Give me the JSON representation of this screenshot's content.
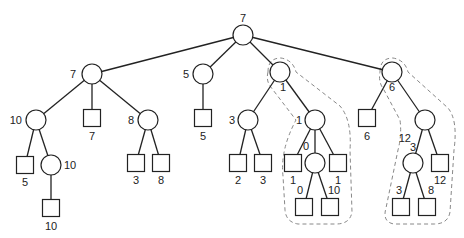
{
  "diagram": {
    "type": "game-tree",
    "node_radius": 10,
    "square_size": 17,
    "nodes": [
      {
        "id": "root",
        "shape": "circle",
        "x": 243,
        "y": 35,
        "label": "7",
        "lx": 243,
        "ly": 22,
        "anchor": "middle"
      },
      {
        "id": "a",
        "shape": "circle",
        "x": 92,
        "y": 74,
        "label": "7",
        "lx": 76,
        "ly": 78,
        "anchor": "end"
      },
      {
        "id": "b",
        "shape": "circle",
        "x": 203,
        "y": 74,
        "label": "5",
        "lx": 189,
        "ly": 78,
        "anchor": "end"
      },
      {
        "id": "c",
        "shape": "circle",
        "x": 280,
        "y": 72,
        "label": "1",
        "lx": 283,
        "ly": 91,
        "anchor": "middle"
      },
      {
        "id": "d",
        "shape": "circle",
        "x": 392,
        "y": 72,
        "label": "6",
        "lx": 392,
        "ly": 91,
        "anchor": "middle"
      },
      {
        "id": "a1",
        "shape": "circle",
        "x": 36,
        "y": 120,
        "label": "10",
        "lx": 22,
        "ly": 124,
        "anchor": "end"
      },
      {
        "id": "a2",
        "shape": "square",
        "x": 92,
        "y": 118,
        "label": "7",
        "lx": 92,
        "ly": 140,
        "anchor": "middle"
      },
      {
        "id": "a3",
        "shape": "circle",
        "x": 148,
        "y": 120,
        "label": "8",
        "lx": 134,
        "ly": 124,
        "anchor": "end"
      },
      {
        "id": "b1",
        "shape": "square",
        "x": 203,
        "y": 118,
        "label": "5",
        "lx": 203,
        "ly": 140,
        "anchor": "middle"
      },
      {
        "id": "c1",
        "shape": "circle",
        "x": 248,
        "y": 120,
        "label": "3",
        "lx": 235,
        "ly": 124,
        "anchor": "end"
      },
      {
        "id": "c2",
        "shape": "circle",
        "x": 315,
        "y": 120,
        "label": "1",
        "lx": 302,
        "ly": 124,
        "anchor": "end"
      },
      {
        "id": "d1",
        "shape": "square",
        "x": 367,
        "y": 118,
        "label": "6",
        "lx": 367,
        "ly": 140,
        "anchor": "middle"
      },
      {
        "id": "d2",
        "shape": "circle",
        "x": 425,
        "y": 120,
        "label": "12",
        "lx": 411,
        "ly": 142,
        "anchor": "end"
      },
      {
        "id": "a11",
        "shape": "square",
        "x": 25,
        "y": 165,
        "label": "5",
        "lx": 25,
        "ly": 186,
        "anchor": "middle"
      },
      {
        "id": "a12",
        "shape": "circle",
        "x": 51,
        "y": 165,
        "label": "10",
        "lx": 64,
        "ly": 169,
        "anchor": "start"
      },
      {
        "id": "a31",
        "shape": "square",
        "x": 136,
        "y": 163,
        "label": "3",
        "lx": 136,
        "ly": 184,
        "anchor": "middle"
      },
      {
        "id": "a32",
        "shape": "square",
        "x": 161,
        "y": 163,
        "label": "8",
        "lx": 161,
        "ly": 184,
        "anchor": "middle"
      },
      {
        "id": "c11",
        "shape": "square",
        "x": 238,
        "y": 163,
        "label": "2",
        "lx": 238,
        "ly": 184,
        "anchor": "middle"
      },
      {
        "id": "c12",
        "shape": "square",
        "x": 263,
        "y": 163,
        "label": "3",
        "lx": 263,
        "ly": 184,
        "anchor": "middle"
      },
      {
        "id": "c21",
        "shape": "square",
        "x": 293,
        "y": 163,
        "label": "1",
        "lx": 293,
        "ly": 184,
        "anchor": "middle"
      },
      {
        "id": "c22",
        "shape": "circle",
        "x": 315,
        "y": 163,
        "label": "0",
        "lx": 309,
        "ly": 150,
        "anchor": "end"
      },
      {
        "id": "c23",
        "shape": "square",
        "x": 338,
        "y": 163,
        "label": "1",
        "lx": 338,
        "ly": 184,
        "anchor": "middle"
      },
      {
        "id": "d21",
        "shape": "circle",
        "x": 413,
        "y": 163,
        "label": "3",
        "lx": 413,
        "ly": 151,
        "anchor": "middle"
      },
      {
        "id": "d22",
        "shape": "square",
        "x": 440,
        "y": 163,
        "label": "12",
        "lx": 440,
        "ly": 184,
        "anchor": "middle"
      },
      {
        "id": "a121",
        "shape": "square",
        "x": 51,
        "y": 208,
        "label": "10",
        "lx": 51,
        "ly": 230,
        "anchor": "middle"
      },
      {
        "id": "c221",
        "shape": "square",
        "x": 304,
        "y": 207,
        "label": "0",
        "lx": 300,
        "ly": 194,
        "anchor": "middle"
      },
      {
        "id": "c222",
        "shape": "square",
        "x": 330,
        "y": 207,
        "label": "10",
        "lx": 334,
        "ly": 194,
        "anchor": "middle"
      },
      {
        "id": "d211",
        "shape": "square",
        "x": 401,
        "y": 207,
        "label": "3",
        "lx": 399,
        "ly": 194,
        "anchor": "middle"
      },
      {
        "id": "d212",
        "shape": "square",
        "x": 427,
        "y": 207,
        "label": "8",
        "lx": 431,
        "ly": 194,
        "anchor": "middle"
      }
    ],
    "edges": [
      [
        "root",
        "a"
      ],
      [
        "root",
        "b"
      ],
      [
        "root",
        "c"
      ],
      [
        "root",
        "d"
      ],
      [
        "a",
        "a1"
      ],
      [
        "a",
        "a2"
      ],
      [
        "a",
        "a3"
      ],
      [
        "b",
        "b1"
      ],
      [
        "c",
        "c1"
      ],
      [
        "c",
        "c2"
      ],
      [
        "d",
        "d1"
      ],
      [
        "d",
        "d2"
      ],
      [
        "a1",
        "a11"
      ],
      [
        "a1",
        "a12"
      ],
      [
        "a3",
        "a31"
      ],
      [
        "a3",
        "a32"
      ],
      [
        "c1",
        "c11"
      ],
      [
        "c1",
        "c12"
      ],
      [
        "c2",
        "c21"
      ],
      [
        "c2",
        "c22"
      ],
      [
        "c2",
        "c23"
      ],
      [
        "d2",
        "d21"
      ],
      [
        "d2",
        "d22"
      ],
      [
        "a12",
        "a121"
      ],
      [
        "c22",
        "c221"
      ],
      [
        "c22",
        "c222"
      ],
      [
        "d21",
        "d211"
      ],
      [
        "d21",
        "d212"
      ]
    ],
    "dashed_regions": [
      {
        "name": "pruned-region-left",
        "path": "M268,72 Q268,58 281,58 Q293,60 296,72 L340,106 Q352,120 350,150 L352,212 Q350,224 336,224 L298,224 Q286,222 285,210 L283,176 Q280,150 296,120 L270,86 Q266,80 268,72 Z"
      },
      {
        "name": "pruned-region-right",
        "path": "M380,72 Q380,58 393,58 Q405,60 408,72 L448,108 Q458,120 454,150 L450,212 Q448,224 434,224 L394,224 Q382,222 386,208 L398,150 Q402,135 400,120 L384,90 Q378,82 380,72 Z"
      }
    ]
  }
}
